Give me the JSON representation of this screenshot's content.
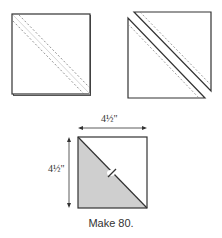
{
  "figures": {
    "step1": {
      "description": "square with two dashed sewing lines along diagonal",
      "shape": "layered-square",
      "stitch_lines": 2,
      "center_line": "drawn diagonal"
    },
    "step2": {
      "description": "square cut apart on diagonal into two triangles",
      "shape": "two-half-square-triangles"
    },
    "step3": {
      "description": "finished half-square-triangle unit, lower-left half shaded",
      "shape": "half-square-triangle",
      "width_label": "4½\"",
      "height_label": "4½\"",
      "press_arrow": "pressing-direction-mark",
      "caption": "Make 80."
    }
  },
  "colors": {
    "line": "#333333",
    "dash": "#777777",
    "shade": "#cfcfcf",
    "background": "#ffffff"
  }
}
